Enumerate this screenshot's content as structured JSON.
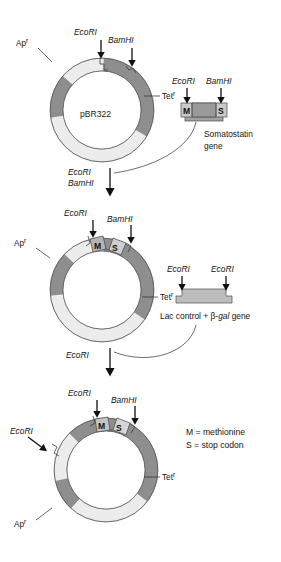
{
  "figure": {
    "colors": {
      "dark_gray": "#8e8e8e",
      "mid_gray": "#a9a9a9",
      "light_gray": "#ececec",
      "insert_gray": "#b4b4b4",
      "gene_dark": "#9a9a9a",
      "gene_light": "#c9c9c9",
      "outline": "#5a5a5a",
      "text": "#141414",
      "background": "#ffffff"
    }
  },
  "stage1": {
    "name": "pBR322 parent plasmid",
    "plasmid_label": "pBR322",
    "site_ecori": "EcoRI",
    "site_bamhi": "BamHI",
    "marker_ap": "Ap",
    "marker_ap_super": "r",
    "marker_tet": "Tet",
    "marker_tet_super": "r",
    "fragment": {
      "name": "somatostatin gene fragment",
      "site_left": "EcoRI",
      "site_right": "BamHI",
      "seg_left": "M",
      "seg_right": "S",
      "caption_line1": "Somatostatin",
      "caption_line2": "gene"
    }
  },
  "transition1": {
    "name": "digest with EcoRI and BamHI",
    "line1": "EcoRI",
    "line2": "BamHI"
  },
  "stage2": {
    "name": "pBR322 with somatostatin gene inserted",
    "site_ecori": "EcoRI",
    "site_bamhi": "BamHI",
    "seg_m": "M",
    "seg_s": "S",
    "marker_ap": "Ap",
    "marker_ap_super": "r",
    "marker_tet": "Tet",
    "marker_tet_super": "r",
    "fragment": {
      "name": "lac control and beta-gal gene fragment",
      "site_left": "EcoRI",
      "site_right": "EcoRI",
      "caption_prefix": "Lac control + ",
      "caption_italic": "gal",
      "caption_beta": "β-",
      "caption_suffix": " gene"
    }
  },
  "transition2": {
    "name": "digest with EcoRI",
    "line1": "EcoRI"
  },
  "stage3": {
    "name": "final recombinant expression plasmid",
    "site_ecori_top": "EcoRI",
    "site_bamhi": "BamHI",
    "site_ecori_left": "EcoRI",
    "seg_m": "M",
    "seg_s": "S",
    "marker_ap": "Ap",
    "marker_ap_super": "r",
    "marker_tet": "Tet",
    "marker_tet_super": "r"
  },
  "legend": {
    "line1": "M = methionine",
    "line2": "S = stop codon"
  }
}
